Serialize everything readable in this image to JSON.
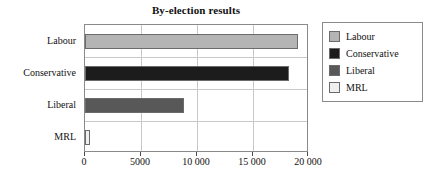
{
  "chart_data": {
    "type": "bar",
    "orientation": "horizontal",
    "title": "By-election results",
    "xlabel": "",
    "ylabel": "",
    "categories": [
      "Labour",
      "Conservative",
      "Liberal",
      "MRL"
    ],
    "values": [
      19000,
      18200,
      8800,
      400
    ],
    "xlim": [
      0,
      20000
    ],
    "xticks": [
      0,
      5000,
      10000,
      15000,
      20000
    ],
    "xtick_labels": [
      "0",
      "5000",
      "10 000",
      "15 000",
      "20 000"
    ],
    "grid": "vertical",
    "legend_position": "right",
    "series": [
      {
        "name": "Labour",
        "value": 19000,
        "color": "#b4b4b4"
      },
      {
        "name": "Conservative",
        "value": 18200,
        "color": "#1c1c1c"
      },
      {
        "name": "Liberal",
        "value": 8800,
        "color": "#585858"
      },
      {
        "name": "MRL",
        "value": 400,
        "color": "#efefef"
      }
    ]
  },
  "legend": {
    "entries": [
      {
        "label": "Labour",
        "color": "#b4b4b4"
      },
      {
        "label": "Conservative",
        "color": "#1c1c1c"
      },
      {
        "label": "Liberal",
        "color": "#585858"
      },
      {
        "label": "MRL",
        "color": "#efefef"
      }
    ]
  },
  "colors": {
    "frame": "#8a8a8a",
    "grid": "#c9c9c9",
    "bar_border": "#6b6b6b",
    "text": "#111111",
    "background": "#ffffff"
  }
}
